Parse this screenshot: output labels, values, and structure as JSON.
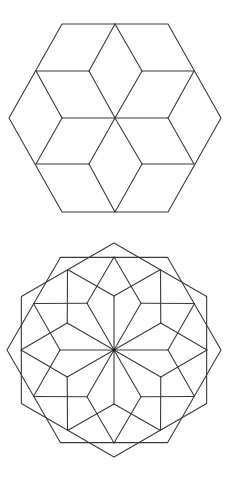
{
  "canvas": {
    "width": 236,
    "height": 484,
    "background": "#ffffff",
    "stroke_color": "#3a3a3a"
  },
  "figures": [
    {
      "name": "hexagon-cube-star",
      "description": "Regular hexagon subdivided into 12 rhombi forming a six-pointed tumbling-block star",
      "hexagon": [
        [
          9,
          118
        ],
        [
          62,
          24
        ],
        [
          168,
          24
        ],
        [
          221,
          118
        ],
        [
          168,
          212
        ],
        [
          62,
          212
        ]
      ],
      "segments": [
        [
          [
            36,
            71
          ],
          [
            89,
            71
          ]
        ],
        [
          [
            142,
            71
          ],
          [
            194,
            71
          ]
        ],
        [
          [
            36,
            164
          ],
          [
            89,
            164
          ]
        ],
        [
          [
            142,
            164
          ],
          [
            194,
            164
          ]
        ],
        [
          [
            62,
            118
          ],
          [
            168,
            118
          ]
        ],
        [
          [
            115,
            24
          ],
          [
            89,
            71
          ]
        ],
        [
          [
            115,
            24
          ],
          [
            142,
            71
          ]
        ],
        [
          [
            89,
            71
          ],
          [
            115,
            118
          ]
        ],
        [
          [
            142,
            71
          ],
          [
            115,
            118
          ]
        ],
        [
          [
            36,
            71
          ],
          [
            62,
            118
          ]
        ],
        [
          [
            62,
            118
          ],
          [
            36,
            164
          ]
        ],
        [
          [
            194,
            71
          ],
          [
            168,
            118
          ]
        ],
        [
          [
            168,
            118
          ],
          [
            194,
            164
          ]
        ],
        [
          [
            115,
            118
          ],
          [
            89,
            164
          ]
        ],
        [
          [
            115,
            118
          ],
          [
            142,
            164
          ]
        ],
        [
          [
            89,
            164
          ],
          [
            115,
            212
          ]
        ],
        [
          [
            142,
            164
          ],
          [
            115,
            212
          ]
        ]
      ]
    },
    {
      "name": "dodecagonal-rosette",
      "description": "Two overlapping hexagons with a 12-fold rhombus rosette",
      "center": [
        114,
        350
      ],
      "spoke_radius": 54,
      "mid_radius": 93,
      "hex_radius": 107,
      "spoke_count": 12,
      "hexagon_offsets_deg": [
        0,
        30
      ]
    }
  ]
}
